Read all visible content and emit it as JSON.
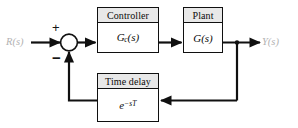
{
  "diagram": {
    "type": "block-diagram",
    "background_color": "#ffffff",
    "line_color": "#101010",
    "header_fill_color": "#e8e8e8",
    "label_color": "#b2b2b2"
  },
  "signals": {
    "input_label": "R(s)",
    "output_label": "Y(s)"
  },
  "summing_junction": {
    "name": "summing-junction",
    "plus_sign": "+",
    "minus_sign": "−",
    "plus_input": "R(s)",
    "minus_input": "feedback"
  },
  "blocks": [
    {
      "id": "controller",
      "header": "Controller",
      "body_base": "G",
      "body_sub": "c",
      "body_suffix": "(s)",
      "body_plain": "Gc(s)"
    },
    {
      "id": "plant",
      "header": "Plant",
      "body_base": "G",
      "body_sub": "",
      "body_suffix": "(s)",
      "body_plain": "G(s)"
    },
    {
      "id": "time_delay",
      "header": "Time delay",
      "body_base": "e",
      "body_sup": "−sT",
      "body_plain": "e^-sT"
    }
  ],
  "connections": [
    {
      "from": "R(s)",
      "to": "summing-junction",
      "arrow": true
    },
    {
      "from": "summing-junction",
      "to": "controller",
      "arrow": true
    },
    {
      "from": "controller",
      "to": "plant",
      "arrow": true
    },
    {
      "from": "plant",
      "to": "Y(s)",
      "arrow": true
    },
    {
      "from": "plant-output-tap",
      "to": "time_delay",
      "arrow": true
    },
    {
      "from": "time_delay",
      "to": "summing-junction",
      "arrow": true
    }
  ]
}
